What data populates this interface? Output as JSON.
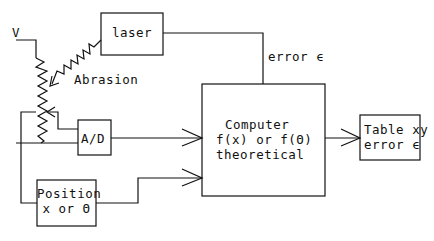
{
  "diagram": {
    "type": "block-diagram",
    "labels": {
      "voltage": "V",
      "laser": "laser",
      "abrasion": "Abrasion",
      "error_signal": "error ϵ",
      "ad_converter": "A/D",
      "position_line1": "Position",
      "position_line2": "x or Θ",
      "computer_line1": "Computer",
      "computer_line2": "f(x) or f(Θ)",
      "computer_line3": "theoretical",
      "table_line1": "Table xy",
      "table_line2": "error ϵ"
    },
    "nodes": [
      {
        "id": "laser",
        "label": "laser"
      },
      {
        "id": "potentiometer",
        "label": "V"
      },
      {
        "id": "ad",
        "label": "A/D"
      },
      {
        "id": "position",
        "label": "Position x or Θ"
      },
      {
        "id": "computer",
        "label": "Computer f(x) or f(Θ) theoretical"
      },
      {
        "id": "table",
        "label": "Table xy error ϵ"
      }
    ],
    "edges": [
      {
        "from": "laser",
        "to": "potentiometer",
        "label": "Abrasion"
      },
      {
        "from": "laser",
        "to": "computer",
        "label": "error ϵ"
      },
      {
        "from": "potentiometer",
        "to": "ad"
      },
      {
        "from": "ad",
        "to": "computer"
      },
      {
        "from": "position",
        "to": "computer"
      },
      {
        "from": "computer",
        "to": "table"
      }
    ]
  }
}
